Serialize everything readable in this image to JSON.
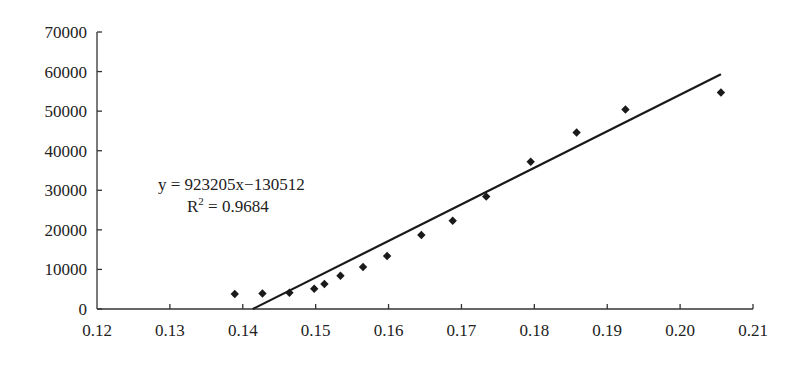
{
  "chart_data": {
    "type": "scatter",
    "title": "",
    "xlabel": "",
    "ylabel": "",
    "xlim": [
      0.12,
      0.21
    ],
    "ylim": [
      0,
      70000
    ],
    "grid": false,
    "legend": null,
    "x_ticks": [
      "0.12",
      "0.13",
      "0.14",
      "0.15",
      "0.16",
      "0.17",
      "0.18",
      "0.19",
      "0.20",
      "0.21"
    ],
    "y_ticks": [
      "0",
      "10000",
      "20000",
      "30000",
      "40000",
      "50000",
      "60000",
      "70000"
    ],
    "series": [
      {
        "name": "data",
        "marker": "diamond",
        "x": [
          0.1389,
          0.1427,
          0.1464,
          0.1498,
          0.1512,
          0.1534,
          0.1565,
          0.1598,
          0.1645,
          0.1688,
          0.1734,
          0.1795,
          0.1858,
          0.1925,
          0.2056
        ],
        "y": [
          3800,
          3900,
          4100,
          5100,
          6300,
          8400,
          10600,
          13400,
          18700,
          22300,
          28400,
          37200,
          44600,
          50400,
          54700
        ]
      }
    ],
    "trendline": {
      "type": "linear",
      "slope": 923205,
      "intercept": -130512,
      "r_squared": 0.9684,
      "x_range": [
        0.14137,
        0.2056
      ]
    },
    "annotations": [
      {
        "text": "y = 923205x−130512"
      },
      {
        "text": "R² = 0.9684",
        "base": "R",
        "sup": "2",
        "rest": " = 0.9684"
      }
    ]
  }
}
